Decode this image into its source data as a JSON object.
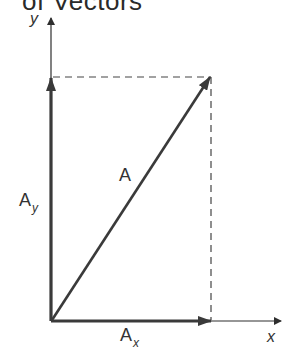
{
  "title": "of Vectors",
  "axes": {
    "x_label": "x",
    "y_label": "y"
  },
  "vectors": {
    "resultant": {
      "label": "A"
    },
    "x_component": {
      "label": "A",
      "subscript": "x"
    },
    "y_component": {
      "label": "A",
      "subscript": "y"
    }
  },
  "colors": {
    "ink": "#2e2e2e",
    "background": "#ffffff"
  }
}
